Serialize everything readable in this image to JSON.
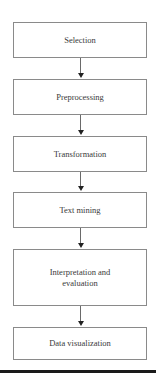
{
  "diagram": {
    "type": "flowchart",
    "direction": "top-to-bottom",
    "steps": [
      {
        "label": "Selection"
      },
      {
        "label": "Preprocessing"
      },
      {
        "label": "Transformation"
      },
      {
        "label": "Text mining"
      },
      {
        "label": "Interpretation and evaluation"
      },
      {
        "label": "Data visualization"
      }
    ],
    "edges": [
      {
        "from": "Selection",
        "to": "Preprocessing"
      },
      {
        "from": "Preprocessing",
        "to": "Transformation"
      },
      {
        "from": "Transformation",
        "to": "Text mining"
      },
      {
        "from": "Text mining",
        "to": "Interpretation and evaluation"
      },
      {
        "from": "Interpretation and evaluation",
        "to": "Data visualization"
      }
    ],
    "colors": {
      "box_border": "#8a8a8a",
      "text": "#3a3a3a",
      "arrow": "#222222",
      "rule": "#1a1a1a"
    }
  }
}
